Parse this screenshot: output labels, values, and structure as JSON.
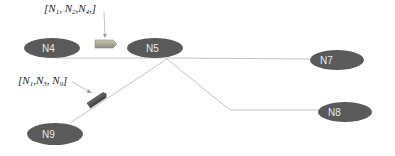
{
  "diagram": {
    "nodes": [
      {
        "id": "N4",
        "label": "N4",
        "cx": 50,
        "cy": 48,
        "rx": 28,
        "ry": 10
      },
      {
        "id": "N5",
        "label": "N5",
        "cx": 155,
        "cy": 48,
        "rx": 28,
        "ry": 10
      },
      {
        "id": "N7",
        "label": "N7",
        "cx": 337,
        "cy": 60,
        "rx": 27,
        "ry": 10
      },
      {
        "id": "N8",
        "label": "N8",
        "cx": 345,
        "cy": 112,
        "rx": 27,
        "ry": 10
      },
      {
        "id": "N9",
        "label": "N9",
        "cx": 55,
        "cy": 133,
        "rx": 28,
        "ry": 11
      }
    ],
    "edges": [
      {
        "from": "N4",
        "to": "N5"
      },
      {
        "from": "N5",
        "to": "N7"
      },
      {
        "from": "N5",
        "to": "N8"
      },
      {
        "from": "N5",
        "to": "N9"
      }
    ],
    "packets": [
      {
        "label": "[N1, N2, N4,]",
        "annotation_parts": [
          "[",
          "N",
          "1",
          ", ",
          "N",
          "2",
          ",",
          "N",
          "4",
          ",]"
        ],
        "edge": "N4-N5"
      },
      {
        "label": "[N1, N3, N9]",
        "annotation_parts": [
          "[",
          "N",
          "1",
          ",",
          "N",
          "3",
          ", ",
          "N",
          "9",
          "]"
        ],
        "edge": "N5-N9"
      }
    ],
    "colors": {
      "node_fill": "#595959",
      "edge": "#bfbfbf",
      "packet_top": "#b0b0a0",
      "packet_bottom": "#5a5a5a",
      "arrow": "#888888"
    }
  }
}
